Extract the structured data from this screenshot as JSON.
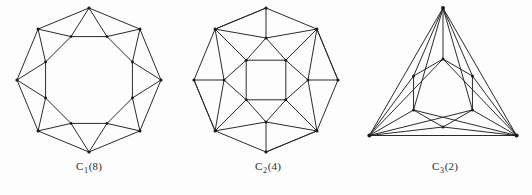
{
  "plate": {
    "background_color": "#fdfdfd",
    "line_color": "#2b2b2b",
    "vertex_color": "#1a1a1a"
  },
  "figures": [
    {
      "id": "figure-1",
      "caption_symbol": "C",
      "caption_subscript": "1",
      "caption_count": "(8)",
      "caption_full": "C1(8)",
      "shape": "octagonal antiprism graph",
      "outer_vertices": 8,
      "inner_vertices": 8,
      "center_x": 89,
      "center_y": 80,
      "outer_radius": 72,
      "inner_radius": 47,
      "outer_rotation_deg": -90,
      "inner_rotation_deg": -67.5
    },
    {
      "id": "figure-2",
      "caption_symbol": "C",
      "caption_subscript": "2",
      "caption_count": "(4)",
      "caption_full": "C2(4)",
      "shape": "octagon with inner square triangulation",
      "outer_vertices": 8,
      "middle_vertices": 4,
      "inner_vertices": 4,
      "center_x": 88,
      "center_y": 80,
      "outer_radius": 72,
      "middle_radius": 42,
      "inner_radius": 28,
      "outer_rotation_deg": -90,
      "middle_rotation_deg": -90,
      "inner_rotation_deg": -45
    },
    {
      "id": "figure-3",
      "caption_symbol": "C",
      "caption_subscript": "3",
      "caption_count": "(2)",
      "caption_full": "C3(2)",
      "shape": "triangle with inner hexagon and corner fans",
      "outer_vertices": 3,
      "inner_vertices": 6,
      "center_x": 85,
      "center_y": 93,
      "outer_radius": 85,
      "hex_radius": 34,
      "outer_rotation_deg": -90,
      "hex_rotation_deg": -90
    }
  ]
}
